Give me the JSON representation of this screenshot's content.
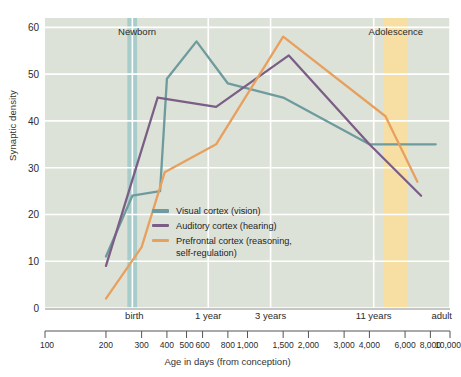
{
  "chart_data": {
    "type": "line",
    "title": "",
    "xlabel": "Age in days (from conception)",
    "ylabel": "Synaptic density",
    "xscale": "log",
    "xlim": [
      100,
      10000
    ],
    "ylim": [
      0,
      62
    ],
    "yticks": [
      0,
      10,
      20,
      30,
      40,
      50,
      60
    ],
    "xticks": [
      100,
      200,
      300,
      400,
      500,
      600,
      800,
      1000,
      1500,
      2000,
      3000,
      4000,
      6000,
      8000,
      10000
    ],
    "xtick_labels": [
      "100",
      "200",
      "300",
      "400",
      "500",
      "600",
      "800",
      "1,000",
      "1,500",
      "2,000",
      "3,000",
      "4,000",
      "6,000",
      "8,000",
      "10,000"
    ],
    "grid": true,
    "legend_position": "center-left",
    "plot_background": "#DDE2D8",
    "gridline_color": "#ffffff",
    "category_axis_labels": [
      {
        "label": "birth",
        "x": 270
      },
      {
        "label": "1 year",
        "x": 640
      },
      {
        "label": "3 years",
        "x": 1300
      },
      {
        "label": "11 years",
        "x": 4200
      },
      {
        "label": "adult",
        "x": 10000
      }
    ],
    "bands": [
      {
        "name": "Newborn",
        "label": "Newborn",
        "color": "#A8CCC9",
        "x_start": 255,
        "x_end": 285,
        "label_x": 285
      },
      {
        "name": "Adolescence",
        "label": "Adolescence",
        "color": "#F7DFA4",
        "x_start": 4700,
        "x_end": 6200,
        "label_x": 5400
      }
    ],
    "series": [
      {
        "name": "Visual cortex (vision)",
        "legend_label": "Visual cortex (vision)",
        "color": "#6E9B9D",
        "points": [
          {
            "x": 200,
            "y": 11
          },
          {
            "x": 270,
            "y": 24
          },
          {
            "x": 370,
            "y": 25
          },
          {
            "x": 400,
            "y": 49
          },
          {
            "x": 560,
            "y": 57
          },
          {
            "x": 800,
            "y": 48
          },
          {
            "x": 1500,
            "y": 45
          },
          {
            "x": 4000,
            "y": 35
          },
          {
            "x": 8500,
            "y": 35
          }
        ]
      },
      {
        "name": "Auditory cortex (hearing)",
        "legend_label": "Auditory cortex (hearing)",
        "color": "#7B5E86",
        "points": [
          {
            "x": 200,
            "y": 9
          },
          {
            "x": 360,
            "y": 45
          },
          {
            "x": 700,
            "y": 43
          },
          {
            "x": 1600,
            "y": 54
          },
          {
            "x": 4000,
            "y": 35
          },
          {
            "x": 7200,
            "y": 24
          }
        ]
      },
      {
        "name": "Prefrontal cortex (reasoning, self-regulation)",
        "legend_label": "Prefrontal cortex (reasoning,\nself-regulation)",
        "color": "#E7A05E",
        "points": [
          {
            "x": 200,
            "y": 2
          },
          {
            "x": 300,
            "y": 13
          },
          {
            "x": 390,
            "y": 29
          },
          {
            "x": 700,
            "y": 35
          },
          {
            "x": 1500,
            "y": 58
          },
          {
            "x": 4800,
            "y": 41
          },
          {
            "x": 6900,
            "y": 27
          }
        ]
      }
    ]
  },
  "axis_rule": {
    "left_label": "100",
    "right_label": "10,000"
  }
}
